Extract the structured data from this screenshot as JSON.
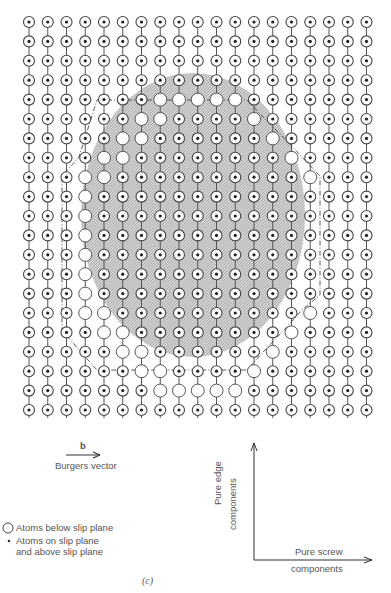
{
  "figure": {
    "caption": "(c)",
    "grid": {
      "columns": 19,
      "rows": 21,
      "x0": 29,
      "dx": 18.75,
      "y0": 22,
      "dy": 19.4,
      "atom_radius": 5.5,
      "dot_radius": 1.6
    },
    "slip_region": {
      "cx": 193,
      "cy": 215,
      "rx": 112,
      "ry": 142,
      "fill": "#c8c8c8"
    },
    "atoms_below_slip_plane": [
      [
        4,
        7
      ],
      [
        4,
        8
      ],
      [
        4,
        9
      ],
      [
        4,
        10
      ],
      [
        4,
        11
      ],
      [
        5,
        6
      ],
      [
        5,
        7
      ],
      [
        5,
        12
      ],
      [
        6,
        5
      ],
      [
        6,
        6
      ],
      [
        6,
        13
      ],
      [
        7,
        4
      ],
      [
        7,
        5
      ],
      [
        7,
        14
      ],
      [
        8,
        3
      ],
      [
        8,
        4
      ],
      [
        8,
        15
      ],
      [
        9,
        3
      ],
      [
        10,
        3
      ],
      [
        11,
        3
      ],
      [
        12,
        3
      ],
      [
        13,
        3
      ],
      [
        14,
        3
      ],
      [
        15,
        3
      ],
      [
        15,
        4
      ],
      [
        15,
        15
      ],
      [
        16,
        4
      ],
      [
        16,
        5
      ],
      [
        16,
        14
      ],
      [
        17,
        5
      ],
      [
        17,
        6
      ],
      [
        17,
        13
      ],
      [
        18,
        6
      ],
      [
        18,
        7
      ],
      [
        18,
        12
      ],
      [
        19,
        7
      ],
      [
        19,
        8
      ],
      [
        19,
        9
      ],
      [
        19,
        10
      ],
      [
        19,
        11
      ]
    ],
    "dislocation_line_points": [
      [
        97,
        100
      ],
      [
        247,
        100
      ],
      [
        265,
        119
      ],
      [
        284,
        138
      ],
      [
        302,
        157
      ],
      [
        320,
        176
      ],
      [
        320,
        295
      ],
      [
        302,
        310
      ],
      [
        284,
        330
      ],
      [
        265,
        350
      ],
      [
        247,
        370
      ],
      [
        97,
        370
      ],
      [
        79,
        350
      ],
      [
        62,
        330
      ],
      [
        62,
        176
      ],
      [
        79,
        157
      ]
    ],
    "colors": {
      "line": "#555555",
      "atom_stroke": "#444444",
      "open_atom_fill": "#ffffff",
      "dot": "#222222"
    }
  },
  "burgers": {
    "symbol": "b",
    "label": "Burgers vector"
  },
  "legend": {
    "open_circle": "Atoms below slip plane",
    "dot_line1": "Atoms on slip plane",
    "dot_line2": "and above slip plane"
  },
  "axes": {
    "y_label_line1": "Pure edge",
    "y_label_line2": "components",
    "x_label_line1": "Pure screw",
    "x_label_line2": "components"
  }
}
